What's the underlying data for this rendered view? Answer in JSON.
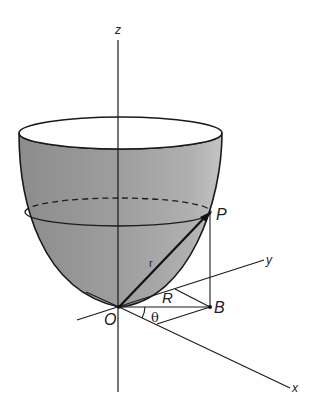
{
  "diagram": {
    "type": "3d-geometry",
    "colors": {
      "surface_fill": "#a8a8a8",
      "surface_dark": "#8f8f8f",
      "rim_fill": "#ffffff",
      "line": "#1a1a1a"
    },
    "axes": {
      "z_label": "z",
      "y_label": "y",
      "x_label": "x"
    },
    "points": {
      "P": "P",
      "B": "B",
      "O": "O"
    },
    "labels": {
      "radius_vector": "r",
      "horizontal_radius": "R",
      "angle": "θ"
    }
  }
}
